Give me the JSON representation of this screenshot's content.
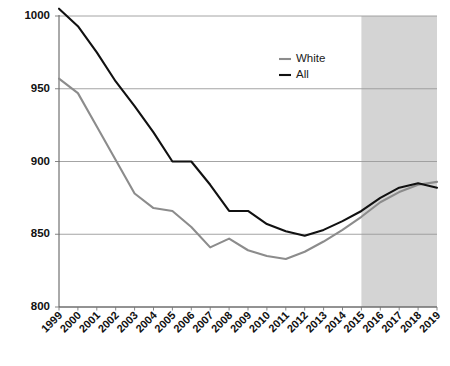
{
  "chart_data": {
    "type": "line",
    "title": "",
    "subtitle": "",
    "xlabel": "",
    "ylabel": "",
    "grid": true,
    "grid_axis": "y",
    "legend_position": "top-right",
    "xlim": [
      "1999",
      "2019"
    ],
    "ylim": [
      800,
      1000
    ],
    "yticks": [
      800,
      850,
      900,
      950,
      1000
    ],
    "ytick_labels": [
      "800",
      "850",
      "900",
      "950",
      "1000"
    ],
    "categories": [
      "1999",
      "2000",
      "2001",
      "2002",
      "2003",
      "2004",
      "2005",
      "2006",
      "2007",
      "2008",
      "2009",
      "2010",
      "2011",
      "2012",
      "2013",
      "2014",
      "2015",
      "2016",
      "2017",
      "2018",
      "2019"
    ],
    "series": [
      {
        "name": "White",
        "color": "#8c8c8c",
        "values": [
          957,
          947,
          924,
          901,
          878,
          868,
          866,
          855,
          841,
          847,
          839,
          835,
          833,
          838,
          845,
          853,
          862,
          872,
          879,
          884,
          886
        ]
      },
      {
        "name": "All",
        "color": "#111111",
        "values": [
          1005,
          993,
          975,
          955,
          938,
          920,
          900,
          900,
          884,
          866,
          866,
          857,
          852,
          849,
          853,
          859,
          866,
          875,
          882,
          885,
          882
        ]
      }
    ],
    "shaded_region": {
      "label": "",
      "start": "2015",
      "end": "2019",
      "color": "#d4d4d4"
    },
    "legend": [
      {
        "label": "White",
        "color": "#8c8c8c"
      },
      {
        "label": "All",
        "color": "#111111"
      }
    ]
  }
}
